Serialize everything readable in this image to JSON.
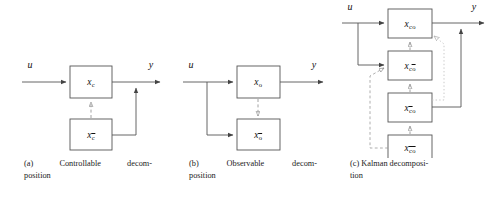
{
  "figure": {
    "panel_count": 3,
    "line_color": "#555555",
    "dashed_color": "#8a8a8a",
    "dotted_color": "#bfbfbf",
    "text_color": "#1a1a1a",
    "background": "#ffffff"
  },
  "panels": [
    {
      "id": "a",
      "caption_line1": "(a)  Controllable  decom-",
      "caption_line2": "position",
      "caption_full": "(a) Controllable decomposition",
      "input_label": "u",
      "output_label": "y",
      "blocks": [
        {
          "name": "block-xc",
          "base": "x",
          "sub": "c",
          "sub_overbar": false,
          "label": "x_c"
        },
        {
          "name": "block-xcbar",
          "base": "x",
          "sub": "c",
          "sub_overbar": true,
          "label": "x_c̄"
        }
      ],
      "connections": [
        {
          "from": "u",
          "to": "block-xc",
          "style": "solid"
        },
        {
          "from": "block-xc",
          "to": "y",
          "style": "solid"
        },
        {
          "from": "block-xcbar",
          "to": "y",
          "style": "solid"
        },
        {
          "from": "block-xcbar",
          "to": "block-xc",
          "style": "dashed",
          "direction": "up"
        }
      ]
    },
    {
      "id": "b",
      "caption_line1": "(b)  Observable  decom-",
      "caption_line2": "position",
      "caption_full": "(b) Observable decomposition",
      "input_label": "u",
      "output_label": "y",
      "blocks": [
        {
          "name": "block-xo",
          "base": "x",
          "sub": "o",
          "sub_overbar": false,
          "label": "x_o"
        },
        {
          "name": "block-xobar",
          "base": "x",
          "sub": "o",
          "sub_overbar": true,
          "label": "x_ō"
        }
      ],
      "connections": [
        {
          "from": "u",
          "to": "block-xo",
          "style": "solid"
        },
        {
          "from": "u",
          "to": "block-xobar",
          "style": "solid"
        },
        {
          "from": "block-xo",
          "to": "y",
          "style": "solid"
        },
        {
          "from": "block-xo",
          "to": "block-xobar",
          "style": "dashed",
          "direction": "down"
        }
      ]
    },
    {
      "id": "c",
      "caption_line1": "(c) Kalman decomposi-",
      "caption_line2": "tion",
      "caption_full": "(c) Kalman decomposition",
      "input_label": "u",
      "output_label": "y",
      "blocks": [
        {
          "name": "block-xco",
          "base": "x",
          "sub1": "c",
          "sub1_overbar": false,
          "sub2": "o",
          "sub2_overbar": false,
          "label": "x_co"
        },
        {
          "name": "block-xcobar",
          "base": "x",
          "sub1": "c",
          "sub1_overbar": false,
          "sub2": "o",
          "sub2_overbar": true,
          "label": "x_cō"
        },
        {
          "name": "block-xcbaro",
          "base": "x",
          "sub1": "c",
          "sub1_overbar": true,
          "sub2": "o",
          "sub2_overbar": false,
          "label": "x_c̄o"
        },
        {
          "name": "block-xcbarobar",
          "base": "x",
          "sub1": "c",
          "sub1_overbar": true,
          "sub2": "o",
          "sub2_overbar": true,
          "label": "x_c̄ō"
        }
      ],
      "connections": [
        {
          "from": "u",
          "to": "block-xco",
          "style": "solid"
        },
        {
          "from": "u",
          "to": "block-xcobar",
          "style": "solid"
        },
        {
          "from": "block-xco",
          "to": "y",
          "style": "solid"
        },
        {
          "from": "block-xcbaro",
          "to": "y",
          "style": "solid"
        },
        {
          "from": "block-xcobar",
          "to": "block-xco",
          "style": "dashed",
          "direction": "up"
        },
        {
          "from": "block-xcbaro",
          "to": "block-xcobar",
          "style": "dashed",
          "direction": "up"
        },
        {
          "from": "block-xcbarobar",
          "to": "block-xcbaro",
          "style": "dashed",
          "direction": "up"
        },
        {
          "from": "block-xcbarobar",
          "to": "block-xcobar",
          "style": "dashed",
          "direction": "up-left"
        },
        {
          "from": "block-xcbaro",
          "to": "block-xco",
          "style": "dotted",
          "direction": "up-right"
        }
      ]
    }
  ]
}
